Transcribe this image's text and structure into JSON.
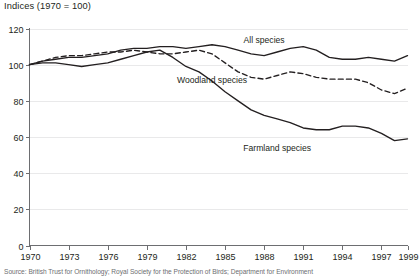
{
  "chart_data": {
    "type": "line",
    "title": "Indices (1970 = 100)",
    "xlabel": "",
    "ylabel": "",
    "ylim": [
      0,
      120
    ],
    "xlim": [
      1970,
      1999
    ],
    "ytick_step": 20,
    "xtick_step": 3,
    "grid": true,
    "legend_position": "inline-annotations",
    "yticks": [
      "0",
      "20",
      "40",
      "60",
      "80",
      "100",
      "120"
    ],
    "xticks": [
      "1970",
      "1973",
      "1976",
      "1979",
      "1982",
      "1985",
      "1988",
      "1991",
      "1994",
      "1997",
      "1999"
    ],
    "x": [
      1970,
      1971,
      1972,
      1973,
      1974,
      1975,
      1976,
      1977,
      1978,
      1979,
      1980,
      1981,
      1982,
      1983,
      1984,
      1985,
      1986,
      1987,
      1988,
      1989,
      1990,
      1991,
      1992,
      1993,
      1994,
      1995,
      1996,
      1997,
      1998,
      1999
    ],
    "series": [
      {
        "name": "All species",
        "style": "solid",
        "label_x": 1988,
        "label_y": 112,
        "values": [
          100,
          102,
          103,
          104,
          104,
          105,
          106,
          108,
          109,
          109,
          110,
          110,
          109,
          110,
          111,
          110,
          108,
          106,
          105,
          107,
          109,
          110,
          108,
          104,
          103,
          103,
          104,
          103,
          102,
          105
        ]
      },
      {
        "name": "Woodland species",
        "style": "dashed",
        "label_x": 1984,
        "label_y": 90,
        "values": [
          100,
          102,
          104,
          105,
          105,
          106,
          107,
          107,
          108,
          107,
          106,
          106,
          107,
          108,
          106,
          101,
          96,
          93,
          92,
          94,
          96,
          95,
          93,
          92,
          92,
          92,
          90,
          86,
          84,
          87
        ]
      },
      {
        "name": "Farmland species",
        "style": "solid",
        "label_x": 1989,
        "label_y": 52,
        "values": [
          100,
          101,
          101,
          100,
          99,
          100,
          101,
          103,
          105,
          107,
          108,
          104,
          99,
          96,
          91,
          85,
          80,
          75,
          72,
          70,
          68,
          65,
          64,
          64,
          66,
          66,
          65,
          62,
          58,
          59
        ]
      }
    ]
  },
  "source": {
    "note": "Source: British Trust for Ornithology; Royal Society for the Protection of Birds; Department for Environment"
  }
}
